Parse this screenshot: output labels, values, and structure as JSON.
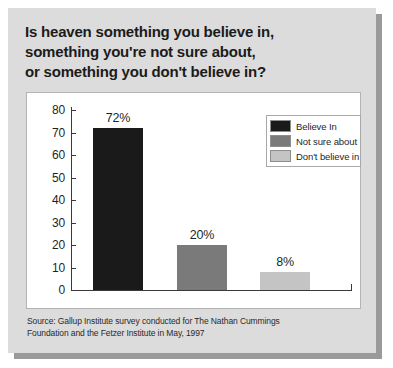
{
  "title": {
    "lines": [
      "Is heaven something you believe in,",
      "something you're not sure about,",
      "or something you don't believe in?"
    ]
  },
  "source": {
    "lines": [
      "Source: Gallup Institute survey conducted for The Nathan Cummings",
      "Foundation and the Fetzer Institute in May, 1997"
    ]
  },
  "colors": {
    "card_background": "#dcdcdc",
    "panel_background": "#ffffff",
    "card_shadow": "#9a9a9a",
    "axis": "#3a3a3a",
    "believe_in": "#1a1a1a",
    "not_sure_about": "#7a7a7a",
    "dont_believe_in": "#c4c4c4",
    "text": "#1f1f1f"
  },
  "chart_data": {
    "type": "bar",
    "title": "Is heaven something you believe in, something you're not sure about, or something you don't believe in?",
    "categories": [
      "Believe In",
      "Not sure about",
      "Don't believe in"
    ],
    "values": [
      72,
      20,
      8
    ],
    "data_labels": [
      "72%",
      "20%",
      "8%"
    ],
    "xlabel": "",
    "ylabel": "",
    "ylim": [
      0,
      80
    ],
    "yticks": [
      0,
      10,
      20,
      30,
      40,
      50,
      60,
      70,
      80
    ],
    "ytick_labels": [
      "0",
      "10",
      "20",
      "30",
      "40",
      "50",
      "60",
      "70",
      "80"
    ],
    "grid": false,
    "legend_position": "top-right",
    "legend": [
      {
        "label": "Believe In",
        "color": "#1a1a1a"
      },
      {
        "label": "Not sure about",
        "color": "#7a7a7a"
      },
      {
        "label": "Don't believe in",
        "color": "#c4c4c4"
      }
    ],
    "source": "Source: Gallup Institute survey conducted for The Nathan Cummings Foundation and the Fetzer Institute in May, 1997"
  }
}
